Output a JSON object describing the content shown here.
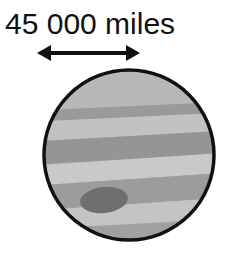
{
  "figure": {
    "caption": "45 000 miles",
    "measurement": {
      "value": "45 000",
      "unit": "miles"
    },
    "background_color": "#ffffff"
  },
  "dimension_arrow": {
    "name": "double-headed-arrow",
    "color": "#111111",
    "x_start": 37,
    "x_end": 140,
    "y": 53,
    "shaft_thickness": 4,
    "head_length": 14,
    "head_half_width": 8
  },
  "planet": {
    "name": "jupiter",
    "outline_color": "#111111",
    "outline_width": 3,
    "center_x": 129,
    "center_y": 155,
    "radius": 85,
    "base_color": "#b3b3b3",
    "bands": [
      {
        "label": "north-polar-light-band",
        "color": "#b8b8b8",
        "y_top": 68,
        "y_bottom": 106,
        "tilt": -3
      },
      {
        "label": "north-dark-belt-1",
        "color": "#9a9a9a",
        "y_top": 106,
        "y_bottom": 117,
        "tilt": -5
      },
      {
        "label": "north-light-zone",
        "color": "#c2c2c2",
        "y_top": 117,
        "y_bottom": 136,
        "tilt": -5
      },
      {
        "label": "north-dark-belt-2",
        "color": "#959595",
        "y_top": 136,
        "y_bottom": 159,
        "tilt": -6
      },
      {
        "label": "equatorial-light-zone",
        "color": "#c9c9c9",
        "y_top": 159,
        "y_bottom": 179,
        "tilt": -7
      },
      {
        "label": "south-dark-belt",
        "color": "#9c9c9c",
        "y_top": 179,
        "y_bottom": 204,
        "tilt": -7
      },
      {
        "label": "south-light-zone",
        "color": "#c4c4c4",
        "y_top": 204,
        "y_bottom": 224,
        "tilt": -7
      },
      {
        "label": "south-polar-dark-band",
        "color": "#a0a0a0",
        "y_top": 224,
        "y_bottom": 244,
        "tilt": -5
      }
    ],
    "great_spot": {
      "label": "great-red-spot",
      "color": "#6f6f6f",
      "center_x": 104,
      "center_y": 200,
      "radius_x": 24,
      "radius_y": 13,
      "rotation": -6
    }
  }
}
